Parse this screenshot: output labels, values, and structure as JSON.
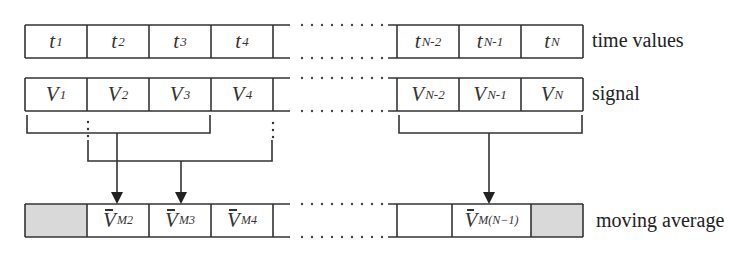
{
  "rows": {
    "time": {
      "label": "time values",
      "cells_left": [
        {
          "base": "t",
          "sub": "1"
        },
        {
          "base": "t",
          "sub": "2"
        },
        {
          "base": "t",
          "sub": "3"
        },
        {
          "base": "t",
          "sub": "4"
        }
      ],
      "cells_right": [
        {
          "base": "t",
          "sub": "N-2"
        },
        {
          "base": "t",
          "sub": "N-1"
        },
        {
          "base": "t",
          "sub": "N"
        }
      ]
    },
    "signal": {
      "label": "signal",
      "cells_left": [
        {
          "base": "V",
          "sub": "1"
        },
        {
          "base": "V",
          "sub": "2"
        },
        {
          "base": "V",
          "sub": "3"
        },
        {
          "base": "V",
          "sub": "4"
        }
      ],
      "cells_right": [
        {
          "base": "V",
          "sub": "N-2"
        },
        {
          "base": "V",
          "sub": "N-1"
        },
        {
          "base": "V",
          "sub": "N"
        }
      ]
    },
    "moving_average": {
      "label": "moving average",
      "cells_left": [
        {
          "base": "",
          "sub": "",
          "shaded": true
        },
        {
          "base": "V",
          "sub": "M2",
          "bar": true
        },
        {
          "base": "V",
          "sub": "M3",
          "bar": true
        },
        {
          "base": "V",
          "sub": "M4",
          "bar": true
        }
      ],
      "cells_right": [
        {
          "base": "",
          "sub": ""
        },
        {
          "base": "V",
          "sub": "M(N−1)",
          "bar": true
        },
        {
          "base": "",
          "sub": "",
          "shaded": true
        }
      ]
    }
  },
  "colors": {
    "line": "#333333",
    "shade": "#d9d9d9",
    "dots": "#444444"
  }
}
